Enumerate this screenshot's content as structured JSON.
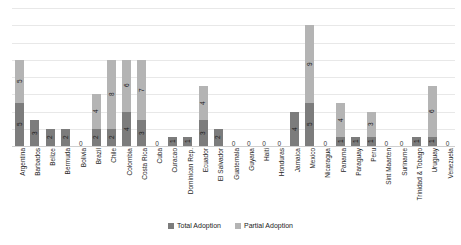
{
  "chart_data": {
    "type": "bar",
    "title": "",
    "subtitle": "",
    "xlabel": "",
    "ylabel": "",
    "ylim": [
      0,
      16
    ],
    "grid": true,
    "stacked": true,
    "legend_position": "bottom",
    "gridline_values": [
      0,
      2,
      4,
      6,
      8,
      10,
      12,
      14,
      16
    ],
    "categories": [
      "Argentina",
      "Barbados",
      "Belize",
      "Bermuda",
      "Bolivia",
      "Brazil",
      "Chile",
      "Colombia",
      "Costa Rica",
      "Cuba",
      "Curacao",
      "Dominican Rep.",
      "Ecuador",
      "El Salvador",
      "Guatemala",
      "Guyana",
      "Haiti",
      "Honduras",
      "Jamaica",
      "Mexico",
      "Nicaragua",
      "Panama",
      "Paraguay",
      "Peru",
      "Sint Maarten",
      "Suriname",
      "Trinidad & Tobago",
      "Uruguay",
      "Venezuela"
    ],
    "series": [
      {
        "name": "Total Adoption",
        "color": "#7c7c7c",
        "values": [
          5,
          3,
          2,
          2,
          0,
          2,
          2,
          4,
          3,
          0,
          1,
          1,
          3,
          2,
          0,
          0,
          0,
          0,
          4,
          5,
          0,
          1,
          1,
          1,
          0,
          0,
          1,
          1,
          0
        ]
      },
      {
        "name": "Partial Adoption",
        "color": "#b4b4b4",
        "values": [
          5,
          0,
          0,
          0,
          0,
          4,
          8,
          6,
          7,
          0,
          0,
          0,
          4,
          0,
          0,
          0,
          0,
          0,
          0,
          9,
          0,
          4,
          0,
          3,
          0,
          0,
          0,
          6,
          0
        ]
      }
    ],
    "zero_labels": [
      "Bolivia",
      "Cuba",
      "Guatemala",
      "Guyana",
      "Haiti",
      "Honduras",
      "Nicaragua",
      "Sint Maarten",
      "Suriname",
      "Venezuela"
    ]
  },
  "legend": {
    "items": [
      {
        "label": "Total Adoption",
        "swatch": "legend-swatch-total"
      },
      {
        "label": "Partial Adoption",
        "swatch": "legend-swatch-partial"
      }
    ]
  }
}
